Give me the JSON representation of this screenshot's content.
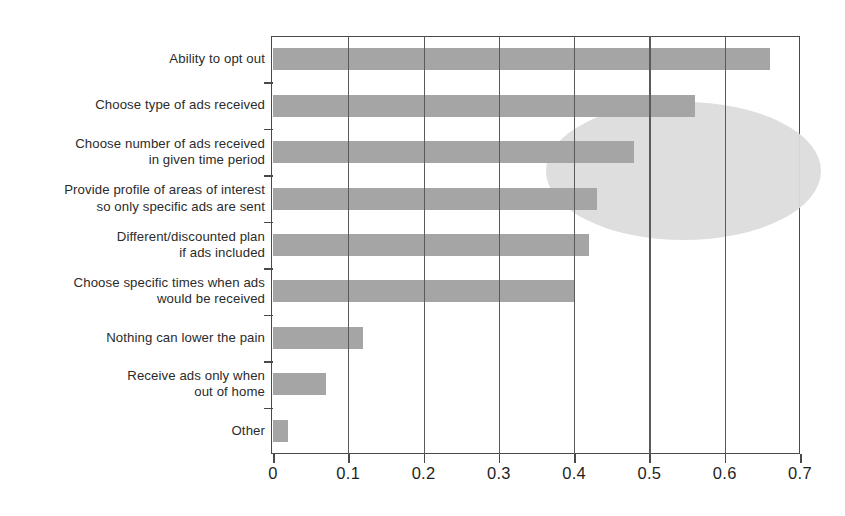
{
  "chart_data": {
    "type": "bar",
    "orientation": "horizontal",
    "title": "",
    "subtitle": "",
    "xlabel": "",
    "ylabel": "",
    "xlim": [
      0,
      0.7
    ],
    "xticks": [
      0,
      0.1,
      0.2,
      0.3,
      0.4,
      0.5,
      0.6,
      0.7
    ],
    "xtick_labels": [
      "0",
      "0.1",
      "0.2",
      "0.3",
      "0.4",
      "0.5",
      "0.6",
      "0.7"
    ],
    "grid": "vertical",
    "legend": "none",
    "categories": [
      "Ability to opt out",
      "Choose type of ads received",
      "Choose number of ads received\nin given time period",
      "Provide profile of areas of interest\nso only specific ads are sent",
      "Different/discounted plan\nif ads included",
      "Choose specific times when ads\nwould be received",
      "Nothing can lower the pain",
      "Receive ads only when\nout of home",
      "Other"
    ],
    "values": [
      0.66,
      0.56,
      0.48,
      0.43,
      0.42,
      0.4,
      0.12,
      0.07,
      0.02
    ],
    "bar_color": "#a5a5a5",
    "annotations": [
      {
        "type": "ellipse-highlight",
        "label": "highlight-ellipse",
        "fill_color": "#dcdcdc",
        "x_center": 0.545,
        "y_center_category_index": 2.4,
        "x_radius": 0.183,
        "y_radius_categories": 2.97
      }
    ],
    "axis_color": "#4a4a4a",
    "grid_color": "#5a5a5a",
    "text_color": "#2b2b2b"
  }
}
